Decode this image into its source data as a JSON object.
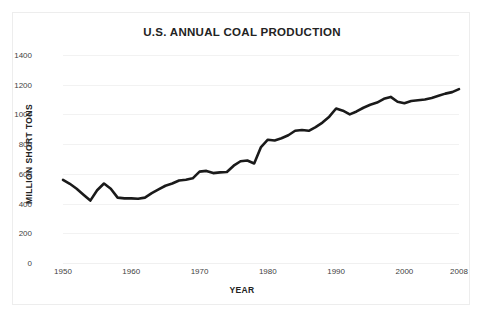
{
  "chart_data": {
    "type": "line",
    "title": "U.S. ANNUAL COAL PRODUCTION",
    "xlabel": "YEAR",
    "ylabel": "MILLION SHORT TONS",
    "xlim": [
      1950,
      2008
    ],
    "ylim": [
      0,
      1400
    ],
    "grid": true,
    "legend": null,
    "line_color": "#1a1a1a",
    "xticks": [
      1950,
      1960,
      1970,
      1980,
      1990,
      2000,
      2008
    ],
    "xtick_labels": [
      "1950",
      "1960",
      "1970",
      "1980",
      "1990",
      "2000",
      "2008"
    ],
    "yticks": [
      0,
      200,
      400,
      600,
      800,
      1000,
      1200,
      1400
    ],
    "ytick_labels": [
      "0",
      "200",
      "400",
      "600",
      "800",
      "1000",
      "1200",
      "1400"
    ],
    "x": [
      1950,
      1951,
      1952,
      1953,
      1954,
      1955,
      1956,
      1957,
      1958,
      1959,
      1960,
      1961,
      1962,
      1963,
      1964,
      1965,
      1966,
      1967,
      1968,
      1969,
      1970,
      1971,
      1972,
      1973,
      1974,
      1975,
      1976,
      1977,
      1978,
      1979,
      1980,
      1981,
      1982,
      1983,
      1984,
      1985,
      1986,
      1987,
      1988,
      1989,
      1990,
      1991,
      1992,
      1993,
      1994,
      1995,
      1996,
      1997,
      1998,
      1999,
      2000,
      2001,
      2002,
      2003,
      2004,
      2005,
      2006,
      2007,
      2008
    ],
    "values": [
      560,
      533,
      500,
      460,
      420,
      490,
      535,
      500,
      440,
      435,
      435,
      432,
      440,
      470,
      495,
      520,
      535,
      555,
      560,
      570,
      615,
      620,
      605,
      610,
      612,
      655,
      685,
      690,
      670,
      780,
      830,
      825,
      840,
      860,
      890,
      895,
      890,
      915,
      945,
      985,
      1040,
      1025,
      1000,
      1020,
      1045,
      1065,
      1080,
      1105,
      1118,
      1085,
      1075,
      1090,
      1095,
      1100,
      1110,
      1125,
      1140,
      1150,
      1170
    ],
    "series": [
      {
        "name": "U.S. Annual Coal Production",
        "unit": "million short tons",
        "values": [
          560,
          533,
          500,
          460,
          420,
          490,
          535,
          500,
          440,
          435,
          435,
          432,
          440,
          470,
          495,
          520,
          535,
          555,
          560,
          570,
          615,
          620,
          605,
          610,
          612,
          655,
          685,
          690,
          670,
          780,
          830,
          825,
          840,
          860,
          890,
          895,
          890,
          915,
          945,
          985,
          1040,
          1025,
          1000,
          1020,
          1045,
          1065,
          1080,
          1105,
          1118,
          1085,
          1075,
          1090,
          1095,
          1100,
          1110,
          1125,
          1140,
          1150,
          1170
        ]
      }
    ]
  }
}
